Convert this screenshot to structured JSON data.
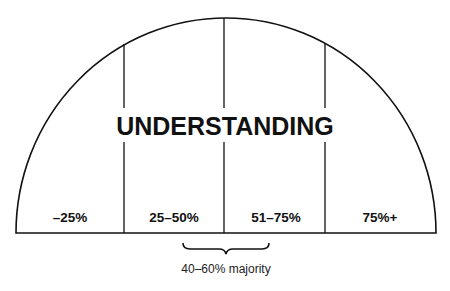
{
  "diagram": {
    "title": "UNDERSTANDING",
    "segments": [
      {
        "label": "–25%"
      },
      {
        "label": "25–50%"
      },
      {
        "label": "51–75%"
      },
      {
        "label": "75%+"
      }
    ],
    "bracket_note": "40–60% majority",
    "colors": {
      "stroke": "#111111",
      "background": "#ffffff"
    }
  }
}
